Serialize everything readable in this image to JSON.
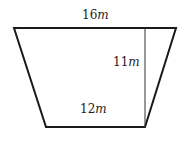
{
  "diagram": {
    "type": "trapezoid",
    "colors": {
      "stroke": "#1a1a1a",
      "background": "#ffffff"
    },
    "vertices": {
      "top_left": [
        14,
        28
      ],
      "top_right": [
        176,
        28
      ],
      "bottom_right": [
        145,
        127
      ],
      "bottom_left": [
        46,
        127
      ]
    },
    "height_line": {
      "x": 145,
      "y1": 28,
      "y2": 127
    },
    "labels": {
      "top_base": {
        "value": "16",
        "unit": "m"
      },
      "height": {
        "value": "11",
        "unit": "m"
      },
      "bottom_base": {
        "value": "12",
        "unit": "m"
      }
    }
  }
}
